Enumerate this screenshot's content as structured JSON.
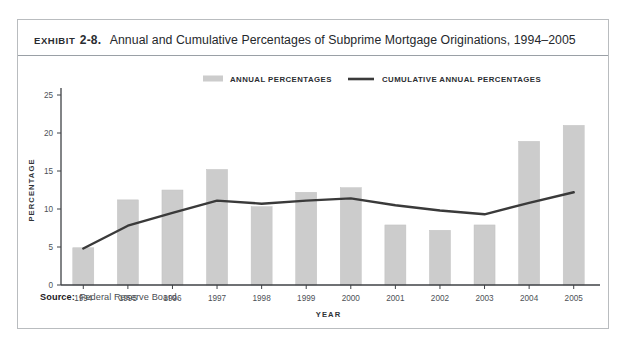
{
  "exhibit": {
    "label": "EXHIBIT",
    "number": "2-8.",
    "title": "Annual and Cumulative Percentages of Subprime Mortgage Originations, 1994–2005"
  },
  "source": {
    "label": "Source:",
    "value": "Federal Reserve Board."
  },
  "colors": {
    "bar": "#cccccc",
    "bar_edge": "#c2c2c2",
    "line": "#3a3a3a",
    "axis": "#3f4246",
    "frame": "#b9bcbf",
    "title_rule": "#9aa0a6",
    "text": "#2a2d31"
  },
  "chart_data": {
    "type": "bar",
    "title": "Annual and Cumulative Percentages of Subprime Mortgage Originations, 1994–2005",
    "xlabel": "YEAR",
    "ylabel": "PERCENTAGE",
    "categories": [
      "1994",
      "1995",
      "1996",
      "1997",
      "1998",
      "1999",
      "2000",
      "2001",
      "2002",
      "2003",
      "2004",
      "2005"
    ],
    "ylim": [
      0,
      25
    ],
    "yticks": [
      0,
      5,
      10,
      15,
      20,
      25
    ],
    "grid": false,
    "legend_position": "top-center",
    "series": [
      {
        "name": "ANNUAL PERCENTAGES",
        "type": "bar",
        "color": "#cccccc",
        "values": [
          4.9,
          11.2,
          12.5,
          15.2,
          10.3,
          12.2,
          12.8,
          7.9,
          7.2,
          7.9,
          18.9,
          21.0
        ]
      },
      {
        "name": "CUMULATIVE ANNUAL PERCENTAGES",
        "type": "line",
        "color": "#3a3a3a",
        "values": [
          4.8,
          7.8,
          9.5,
          11.1,
          10.7,
          11.1,
          11.4,
          10.5,
          9.8,
          9.3,
          10.8,
          12.2
        ]
      }
    ]
  }
}
